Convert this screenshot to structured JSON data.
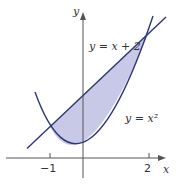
{
  "figure": {
    "type": "region-between-curves",
    "axes": {
      "x_label": "x",
      "y_label": "y",
      "x_ticks": [
        {
          "value": -1,
          "label": "−1"
        },
        {
          "value": 2,
          "label": "2"
        }
      ]
    },
    "curves": [
      {
        "name": "line",
        "label": "y = x + 2",
        "equation": "y = x + 2"
      },
      {
        "name": "parabola",
        "label": "y = x²",
        "equation": "y = x^2"
      }
    ],
    "shaded_region": {
      "between": [
        "y = x + 2",
        "y = x^2"
      ],
      "x_from": -1,
      "x_to": 2
    },
    "intersections": [
      {
        "x": -1,
        "y": 1
      },
      {
        "x": 2,
        "y": 4
      }
    ],
    "colors": {
      "curve": "#2e3578",
      "fill": "#c8c9e6",
      "axis": "#555555"
    }
  }
}
